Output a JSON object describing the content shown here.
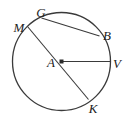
{
  "figure": {
    "kind": "circle-geometry-diagram",
    "width": 127,
    "height": 121,
    "background_color": "#ffffff",
    "stroke_color": "#3a3a3a",
    "label_color": "#222222",
    "circle": {
      "name": "circle-A",
      "center_label": "A",
      "center_x": 61.5,
      "center_y": 61.5,
      "radius": 49,
      "stroke_width": 1.3
    },
    "center_dot": {
      "name": "center-point-A",
      "x": 61.5,
      "y": 61.5,
      "size": 4
    },
    "segments": [
      {
        "name": "diameter-MK",
        "label": "MK",
        "type": "diameter",
        "x1": 27.5,
        "y1": 26.5,
        "x2": 88.5,
        "y2": 99.5
      },
      {
        "name": "radius-AV",
        "label": "AV",
        "type": "radius",
        "x1": 61.5,
        "y1": 61.5,
        "x2": 110.5,
        "y2": 61.5
      },
      {
        "name": "chord-GB",
        "label": "GB",
        "type": "chord",
        "x1": 41.5,
        "y1": 18.0,
        "x2": 99.5,
        "y2": 36.0
      }
    ],
    "points": [
      {
        "name": "point-M",
        "label": "M",
        "label_x": 19,
        "label_y": 27,
        "on_circle": true
      },
      {
        "name": "point-G",
        "label": "G",
        "label_x": 41,
        "label_y": 12,
        "on_circle": true
      },
      {
        "name": "point-B",
        "label": "B",
        "label_x": 107,
        "label_y": 35,
        "on_circle": true
      },
      {
        "name": "point-V",
        "label": "V",
        "label_x": 117,
        "label_y": 63,
        "on_circle": true
      },
      {
        "name": "point-K",
        "label": "K",
        "label_x": 93,
        "label_y": 108,
        "on_circle": true
      },
      {
        "name": "point-A",
        "label": "A",
        "label_x": 51,
        "label_y": 62,
        "on_circle": false
      }
    ]
  }
}
